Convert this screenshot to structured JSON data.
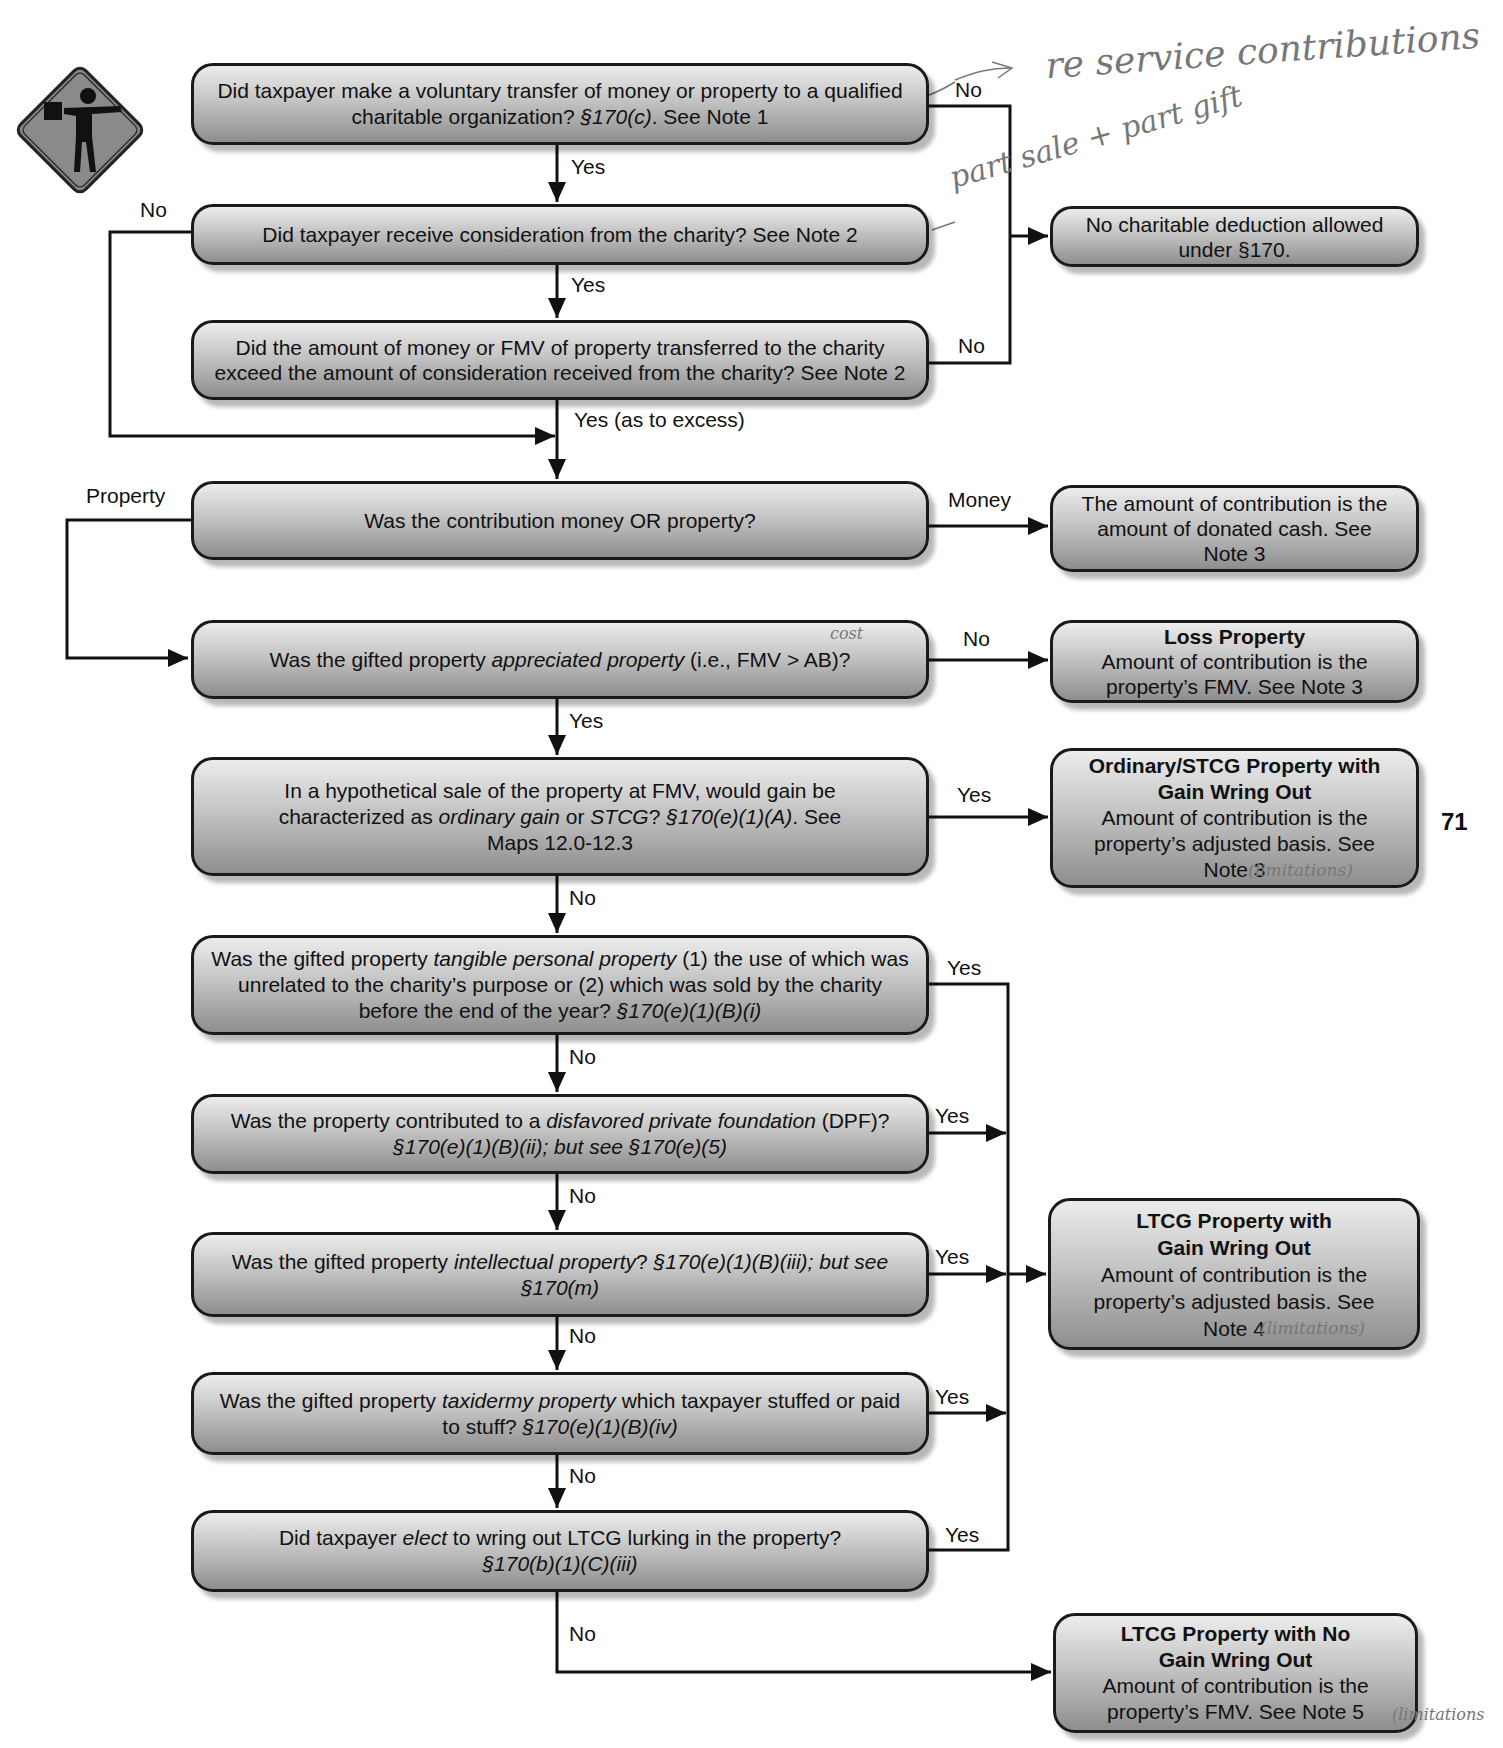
{
  "page_number": "71",
  "sign_icon": "flagger-road-sign-icon",
  "questions": [
    {
      "id": "q1",
      "parts": [
        {
          "t": "Did taxpayer make a voluntary transfer of money or property to a qualified charitable organization?  "
        },
        {
          "t": "§170(c)",
          "i": true
        },
        {
          "t": ".  See Note 1"
        }
      ]
    },
    {
      "id": "q2",
      "parts": [
        {
          "t": "Did taxpayer receive consideration from the charity?  See Note 2"
        }
      ]
    },
    {
      "id": "q3",
      "parts": [
        {
          "t": "Did the amount of money or FMV of property transferred to the charity exceed the amount of consideration received from the charity?  See Note 2"
        }
      ]
    },
    {
      "id": "q4",
      "parts": [
        {
          "t": "Was the contribution money OR property?"
        }
      ]
    },
    {
      "id": "q5",
      "parts": [
        {
          "t": "Was the gifted property "
        },
        {
          "t": "appreciated property",
          "i": true
        },
        {
          "t": " (i.e., FMV > AB)?"
        }
      ]
    },
    {
      "id": "q6",
      "parts": [
        {
          "t": "In a hypothetical sale of the property at FMV, would gain be characterized as "
        },
        {
          "t": "ordinary gain",
          "i": true
        },
        {
          "t": " or "
        },
        {
          "t": "STCG",
          "i": true
        },
        {
          "t": "?  "
        },
        {
          "t": "§170(e)(1)(A)",
          "i": true
        },
        {
          "t": ". See Maps 12.0-12.3"
        }
      ]
    },
    {
      "id": "q7",
      "parts": [
        {
          "t": "Was the gifted property "
        },
        {
          "t": "tangible personal property",
          "i": true
        },
        {
          "t": " (1) the use of which was unrelated to the charity’s purpose or (2) which was sold by the charity before the end of the year?  "
        },
        {
          "t": "§170(e)(1)(B)(i)",
          "i": true
        }
      ]
    },
    {
      "id": "q8",
      "parts": [
        {
          "t": "Was the property contributed to a "
        },
        {
          "t": "disfavored private foundation",
          "i": true
        },
        {
          "t": " (DPF)? "
        },
        {
          "t": "§170(e)(1)(B)(ii); but see §170(e)(5)",
          "i": true
        }
      ]
    },
    {
      "id": "q9",
      "parts": [
        {
          "t": "Was the gifted property "
        },
        {
          "t": "intellectual property",
          "i": true
        },
        {
          "t": "?  "
        },
        {
          "t": "§170(e)(1)(B)(iii); but see §170(m)",
          "i": true
        }
      ]
    },
    {
      "id": "q10",
      "parts": [
        {
          "t": "Was the gifted property "
        },
        {
          "t": "taxidermy property",
          "i": true
        },
        {
          "t": " which taxpayer stuffed or paid to stuff?  "
        },
        {
          "t": "§170(e)(1)(B)(iv)",
          "i": true
        }
      ]
    },
    {
      "id": "q11",
      "parts": [
        {
          "t": "Did taxpayer "
        },
        {
          "t": "elect",
          "i": true
        },
        {
          "t": " to wring out LTCG lurking in the property? "
        },
        {
          "t": "§170(b)(1)(C)(iii)",
          "i": true
        }
      ]
    }
  ],
  "outcomes": {
    "no_deduction": {
      "title": "",
      "body": "No charitable deduction allowed under §170."
    },
    "money": {
      "title": "",
      "body": "The amount of contribution is the amount of donated cash. See Note 3"
    },
    "loss": {
      "title": "Loss Property",
      "body": "Amount of contribution is the property’s FMV.  See Note 3"
    },
    "ordinary": {
      "title": "Ordinary/STCG Property with Gain Wring Out",
      "body": "Amount of contribution is the property’s adjusted basis.  See Note 3"
    },
    "ltcg_gain": {
      "title": "LTCG Property with Gain Wring Out",
      "body": "Amount of contribution is the property’s adjusted basis.  See Note 4"
    },
    "ltcg_nogain": {
      "title": "LTCG Property with No Gain Wring Out",
      "body": "Amount of contribution is the property’s FMV.  See Note 5"
    }
  },
  "edge_labels": {
    "q1_yes": "Yes",
    "q1_no": "No",
    "q2_no": "No",
    "q2_yes": "Yes",
    "q3_no": "No",
    "q3_yes": "Yes (as to excess)",
    "q4_property": "Property",
    "q4_money": "Money",
    "q5_no": "No",
    "q5_yes": "Yes",
    "q6_yes": "Yes",
    "q6_no": "No",
    "q7_yes": "Yes",
    "q7_no": "No",
    "q8_yes": "Yes",
    "q8_no": "No",
    "q9_yes": "Yes",
    "q9_no": "No",
    "q10_yes": "Yes",
    "q10_no": "No",
    "q11_yes": "Yes",
    "q11_no": "No"
  },
  "handwritten": {
    "note1": "re service contributions",
    "note2": "part sale + part gift",
    "note3": "cost",
    "note4": "(limitations)",
    "note5": "(limitations)",
    "note6": "(limitations"
  }
}
